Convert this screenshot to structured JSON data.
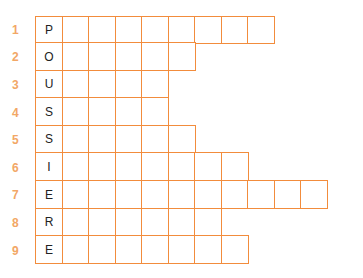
{
  "colors": {
    "grid_line": "#F28C3C",
    "row_number": "#F2A766",
    "letter": "#222222"
  },
  "puzzle": {
    "vertical_word": "POUSSIERE",
    "rows": [
      {
        "number": "1",
        "letter": "P",
        "cells": 9
      },
      {
        "number": "2",
        "letter": "O",
        "cells": 6
      },
      {
        "number": "3",
        "letter": "U",
        "cells": 5
      },
      {
        "number": "4",
        "letter": "S",
        "cells": 5
      },
      {
        "number": "5",
        "letter": "S",
        "cells": 6
      },
      {
        "number": "6",
        "letter": "I",
        "cells": 8
      },
      {
        "number": "7",
        "letter": "E",
        "cells": 11
      },
      {
        "number": "8",
        "letter": "R",
        "cells": 7
      },
      {
        "number": "9",
        "letter": "E",
        "cells": 8
      }
    ]
  }
}
